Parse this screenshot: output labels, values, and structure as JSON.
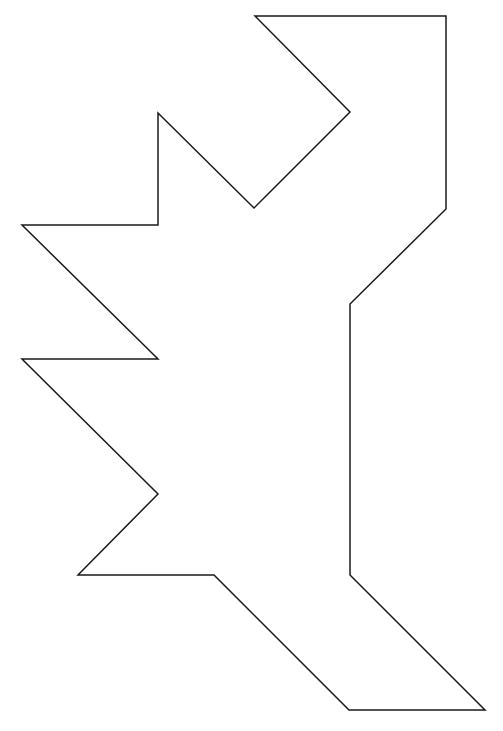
{
  "figure": {
    "width": 503,
    "height": 731,
    "background": "#ffffff",
    "stroke_color": "#1a1a1a",
    "stroke_width": 1.5,
    "vertices": [
      [
        255,
        16
      ],
      [
        446,
        16
      ],
      [
        446,
        209
      ],
      [
        350,
        304
      ],
      [
        350,
        575
      ],
      [
        485,
        710
      ],
      [
        349,
        710
      ],
      [
        214,
        575
      ],
      [
        78,
        575
      ],
      [
        158,
        494
      ],
      [
        22,
        359
      ],
      [
        158,
        359
      ],
      [
        22,
        225
      ],
      [
        158,
        225
      ],
      [
        158,
        113
      ],
      [
        254,
        208
      ],
      [
        350,
        112
      ]
    ]
  }
}
